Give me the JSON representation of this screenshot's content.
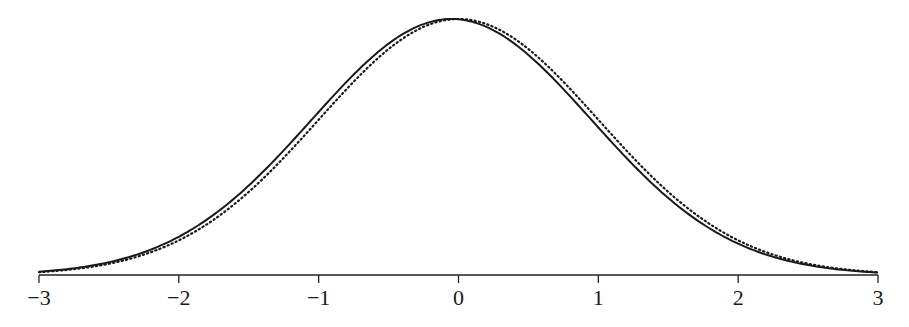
{
  "chart_data": {
    "type": "line",
    "title": "",
    "xlabel": "",
    "ylabel": "",
    "xlim": [
      -3,
      3
    ],
    "ylim": [
      0,
      0.4
    ],
    "grid": false,
    "legend": null,
    "x_ticks": [
      -3,
      -2,
      -1,
      0,
      1,
      2,
      3
    ],
    "x_tick_labels": [
      "−3",
      "−2",
      "−1",
      "0",
      "1",
      "2",
      "3"
    ],
    "series": [
      {
        "name": "solid-curve",
        "style": "solid",
        "description": "bell-shaped density, peak slightly left of 0",
        "x": [
          -3,
          -2.5,
          -2,
          -1.5,
          -1,
          -0.5,
          -0.05,
          0,
          0.5,
          1,
          1.5,
          2,
          2.5,
          3
        ],
        "values": [
          0.005,
          0.019,
          0.057,
          0.135,
          0.247,
          0.355,
          0.399,
          0.398,
          0.345,
          0.236,
          0.125,
          0.05,
          0.016,
          0.004
        ]
      },
      {
        "name": "dotted-curve",
        "style": "dotted",
        "description": "standard normal density N(0,1)",
        "x": [
          -3,
          -2.5,
          -2,
          -1.5,
          -1,
          -0.5,
          0,
          0.5,
          1,
          1.5,
          2,
          2.5,
          3
        ],
        "values": [
          0.004,
          0.018,
          0.054,
          0.13,
          0.242,
          0.352,
          0.399,
          0.352,
          0.242,
          0.13,
          0.054,
          0.018,
          0.004
        ]
      }
    ],
    "params": {
      "solid_mean": -0.05,
      "solid_sd": 1.0,
      "dotted_mean": 0.0,
      "dotted_sd": 1.0
    }
  }
}
